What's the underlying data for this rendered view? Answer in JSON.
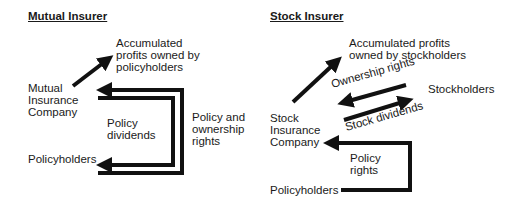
{
  "mutual": {
    "title": "Mutual Insurer",
    "profits_label": "Accumulated\nprofits owned by\npolicyholders",
    "company_label": "Mutual\nInsurance\nCompany",
    "policyholders_label": "Policyholders",
    "dividends_label": "Policy\ndividends",
    "rights_label": "Policy and\nownership\nrights"
  },
  "stock": {
    "title": "Stock Insurer",
    "profits_label": "Accumulated profits\nowned by stockholders",
    "ownership_label": "Ownership rights",
    "stockholders_label": "Stockholders",
    "dividends_label": "Stock dividends",
    "company_label": "Stock\nInsurance\nCompany",
    "policy_rights_label": "Policy\nrights",
    "policyholders_label": "Policyholders"
  },
  "colors": {
    "arrow": "#111111",
    "text": "#1a1a1a",
    "background": "#ffffff"
  }
}
